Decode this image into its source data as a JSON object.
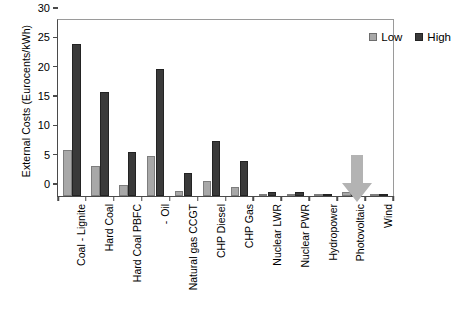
{
  "chart_data": {
    "type": "bar",
    "title": "",
    "xlabel": "",
    "ylabel": "External Costs (Eurocents/kWh)",
    "ylim": [
      0,
      30
    ],
    "yticks": [
      0,
      5,
      10,
      15,
      20,
      25,
      30
    ],
    "grid": false,
    "legend_position": "top-right",
    "categories": [
      "Coal - Lignite",
      "Hard Coal",
      "Hard Coal PBFC",
      "Oil",
      "Natural gas CCGT",
      "CHP Diesel",
      "CHP Gas",
      "Nuclear LWR",
      "Nuclear PWR",
      "Hydropower",
      "Photovoltaic",
      "Wind"
    ],
    "series": [
      {
        "name": "Low",
        "color": "#a8a8a8",
        "values": [
          7.9,
          5.2,
          1.8,
          6.8,
          0.9,
          2.6,
          1.5,
          0.4,
          0.3,
          0.15,
          0.7,
          0.1
        ]
      },
      {
        "name": "High",
        "color": "#3a3a3a",
        "values": [
          25.9,
          17.7,
          7.5,
          21.6,
          4.0,
          9.3,
          6.0,
          0.7,
          0.6,
          0.25,
          1.3,
          0.2
        ]
      }
    ],
    "annotations": [
      {
        "name": "down-arrow",
        "target": "Hydropower",
        "color": "#b3b3b3"
      }
    ]
  },
  "oil_label_prefix": "-"
}
